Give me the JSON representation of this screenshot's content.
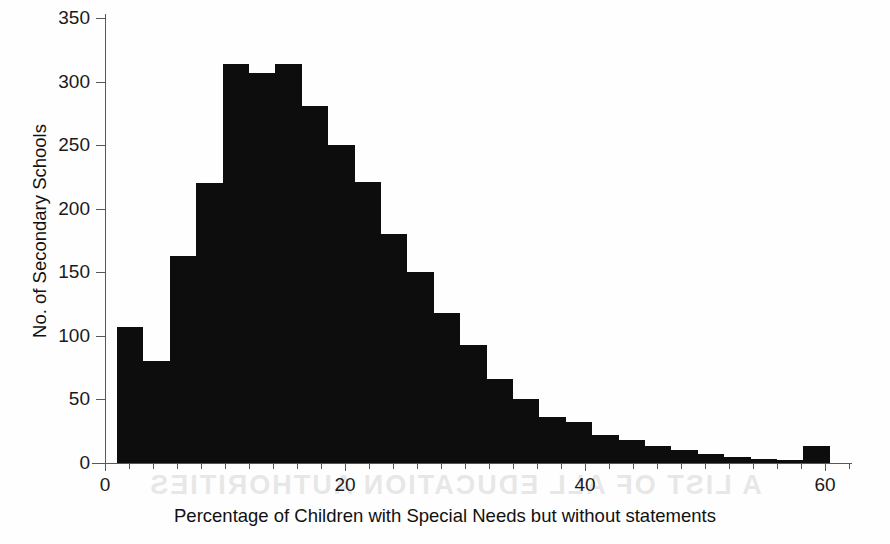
{
  "figure": {
    "background_color": "#fefefe",
    "bar_color": "#0d0d0d",
    "axis_color": "#58585a",
    "ghost_text": "A LIST OF ALL EDUCATION AUTHORITIES"
  },
  "chart_data": {
    "type": "bar",
    "title": "",
    "subtitle": "",
    "xlabel": "Percentage of Children with Special Needs but without statements",
    "ylabel": "No. of Secondary Schools",
    "xlim": [
      0,
      62
    ],
    "ylim": [
      0,
      350
    ],
    "grid": false,
    "legend": false,
    "x_ticks": [
      0,
      20,
      40,
      60
    ],
    "x_tick_labels": [
      "0",
      "20",
      "40",
      "60"
    ],
    "x_minor_tick_step": 2,
    "y_ticks": [
      0,
      50,
      100,
      150,
      200,
      250,
      300,
      350
    ],
    "y_tick_labels": [
      "0",
      "50",
      "100",
      "150",
      "200",
      "250",
      "300",
      "350"
    ],
    "bin_width": 2.2,
    "bin_start": 1.0,
    "bin_edges": [
      1.0,
      3.2,
      5.4,
      7.6,
      9.8,
      12.0,
      14.2,
      16.4,
      18.6,
      20.8,
      23.0,
      25.2,
      27.4,
      29.6,
      31.8,
      34.0,
      36.2,
      38.4,
      40.6,
      42.8,
      45.0,
      47.2,
      49.4,
      51.6,
      53.8,
      56.0,
      58.2,
      60.4
    ],
    "categories": [
      "1.0-3.2",
      "3.2-5.4",
      "5.4-7.6",
      "7.6-9.8",
      "9.8-12.0",
      "12.0-14.2",
      "14.2-16.4",
      "16.4-18.6",
      "18.6-20.8",
      "20.8-23.0",
      "23.0-25.2",
      "25.2-27.4",
      "27.4-29.6",
      "29.6-31.8",
      "31.8-34.0",
      "34.0-36.2",
      "36.2-38.4",
      "38.4-40.6",
      "40.6-42.8",
      "42.8-45.0",
      "45.0-47.2",
      "47.2-49.4",
      "49.4-51.6",
      "51.6-53.8",
      "53.8-56.0",
      "56.0-58.2",
      "58.2-60.4"
    ],
    "values": [
      107,
      80,
      163,
      220,
      314,
      307,
      314,
      281,
      250,
      221,
      180,
      150,
      118,
      93,
      66,
      50,
      36,
      32,
      22,
      18,
      13,
      10,
      7,
      5,
      3,
      2,
      13
    ]
  }
}
